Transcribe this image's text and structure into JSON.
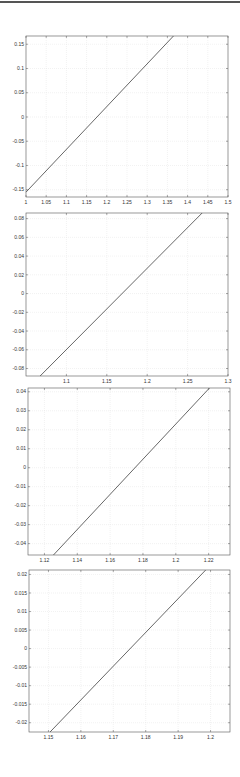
{
  "figure": {
    "line_color": "#404040",
    "grid_color": "#e4e4e4",
    "axis_color": "#555555"
  },
  "chart_data": [
    {
      "type": "line",
      "title": "",
      "xlabel": "",
      "ylabel": "",
      "grid": true,
      "xlim": [
        1.0,
        1.5
      ],
      "ylim": [
        -0.165,
        0.167
      ],
      "xticks": [
        1,
        1.05,
        1.1,
        1.15,
        1.2,
        1.25,
        1.3,
        1.35,
        1.4,
        1.45,
        1.5
      ],
      "xtick_labels": [
        "1",
        "1.05",
        "1.1",
        "1.15",
        "1.2",
        "1.25",
        "1.3",
        "1.35",
        "1.4",
        "1.45",
        "1.5"
      ],
      "yticks": [
        0.15,
        0.1,
        0.05,
        0,
        -0.05,
        -0.1,
        -0.15
      ],
      "ytick_labels": [
        "0.15",
        "0.1",
        "0.05",
        "0",
        "-0.05",
        "-0.1",
        "-0.15"
      ],
      "series": [
        {
          "name": "f(x)",
          "x": [
            1.0,
            1.365
          ],
          "y": [
            -0.155,
            0.167
          ]
        }
      ],
      "box": {
        "left": 26,
        "top": 36,
        "right": 228,
        "bottom": 197
      }
    },
    {
      "type": "line",
      "title": "",
      "xlabel": "",
      "ylabel": "",
      "grid": true,
      "xlim": [
        1.05,
        1.3
      ],
      "ylim": [
        -0.088,
        0.086
      ],
      "xticks": [
        1.1,
        1.15,
        1.2,
        1.25,
        1.3
      ],
      "xtick_labels": [
        "1.1",
        "1.15",
        "1.2",
        "1.25",
        "1.3"
      ],
      "yticks": [
        0.08,
        0.06,
        0.04,
        0.02,
        0,
        -0.02,
        -0.04,
        -0.06,
        -0.08
      ],
      "ytick_labels": [
        "0.08",
        "0.06",
        "0.04",
        "0.02",
        "0",
        "-0.02",
        "-0.04",
        "-0.06",
        "-0.08"
      ],
      "series": [
        {
          "name": "f(x)",
          "x": [
            1.0675,
            1.268
          ],
          "y": [
            -0.088,
            0.086
          ]
        }
      ],
      "box": {
        "left": 26,
        "top": 213,
        "right": 228,
        "bottom": 376
      }
    },
    {
      "type": "line",
      "title": "",
      "xlabel": "",
      "ylabel": "",
      "grid": true,
      "xlim": [
        1.11,
        1.233
      ],
      "ylim": [
        -0.046,
        0.042
      ],
      "xticks": [
        1.12,
        1.14,
        1.16,
        1.18,
        1.2,
        1.22
      ],
      "xtick_labels": [
        "1.12",
        "1.14",
        "1.16",
        "1.18",
        "1.2",
        "1.22"
      ],
      "yticks": [
        0.04,
        0.03,
        0.02,
        0.01,
        0,
        -0.01,
        -0.02,
        -0.03,
        -0.04
      ],
      "ytick_labels": [
        "0.04",
        "0.03",
        "0.02",
        "0.01",
        "0",
        "-0.01",
        "-0.02",
        "-0.03",
        "-0.04"
      ],
      "series": [
        {
          "name": "f(x)",
          "x": [
            1.1255,
            1.2205
          ],
          "y": [
            -0.046,
            0.042
          ]
        }
      ],
      "box": {
        "left": 28,
        "top": 388,
        "right": 230,
        "bottom": 555
      }
    },
    {
      "type": "line",
      "title": "",
      "xlabel": "",
      "ylabel": "",
      "grid": true,
      "xlim": [
        1.144,
        1.206
      ],
      "ylim": [
        -0.0225,
        0.0212
      ],
      "xticks": [
        1.15,
        1.16,
        1.17,
        1.18,
        1.19,
        1.2
      ],
      "xtick_labels": [
        "1.15",
        "1.16",
        "1.17",
        "1.18",
        "1.19",
        "1.2"
      ],
      "yticks": [
        0.02,
        0.015,
        0.01,
        0.005,
        0,
        -0.005,
        -0.01,
        -0.015,
        -0.02
      ],
      "ytick_labels": [
        "0.02",
        "0.015",
        "0.01",
        "0.005",
        "0",
        "-0.005",
        "-0.01",
        "-0.015",
        "-0.02"
      ],
      "series": [
        {
          "name": "f(x)",
          "x": [
            1.1505,
            1.1985
          ],
          "y": [
            -0.0225,
            0.0212
          ]
        }
      ],
      "box": {
        "left": 29,
        "top": 570,
        "right": 230,
        "bottom": 732
      }
    }
  ]
}
